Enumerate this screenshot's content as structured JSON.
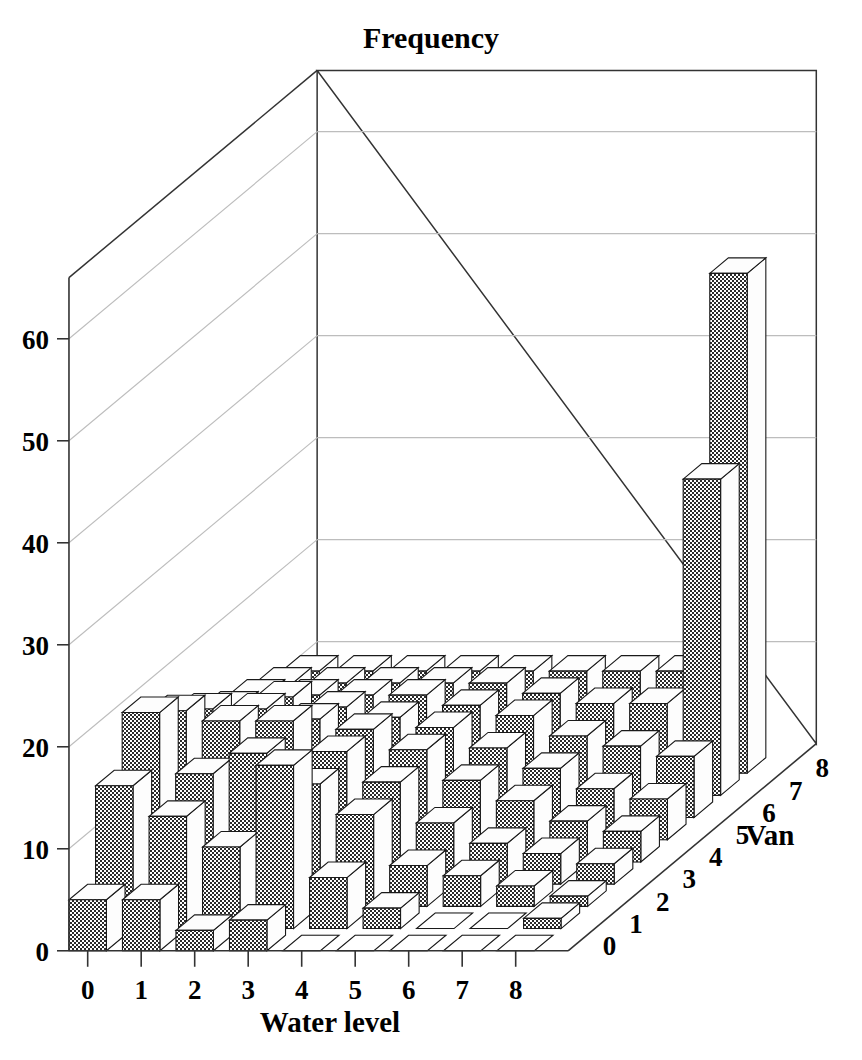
{
  "chart_data": {
    "type": "bar",
    "subtype": "3d-bar",
    "title": "Frequency",
    "xlabel": "Water level",
    "ylabel": "Frequency",
    "zlabel": "Van",
    "x_categories": [
      "0",
      "1",
      "2",
      "3",
      "4",
      "5",
      "6",
      "7",
      "8"
    ],
    "z_categories": [
      "0",
      "1",
      "2",
      "3",
      "4",
      "5",
      "6",
      "7",
      "8"
    ],
    "yticks": [
      "0",
      "10",
      "20",
      "30",
      "40",
      "50",
      "60"
    ],
    "ylim": [
      0,
      60
    ],
    "grid": true,
    "legend": "none",
    "values": [
      [
        5,
        5,
        2,
        3,
        0,
        0,
        0,
        0,
        0
      ],
      [
        14,
        11,
        8,
        16,
        5,
        2,
        0,
        0,
        1
      ],
      [
        19,
        13,
        15,
        12,
        9,
        4,
        3,
        2,
        1
      ],
      [
        17,
        16,
        16,
        13,
        10,
        6,
        4,
        3,
        2
      ],
      [
        15,
        15,
        14,
        13,
        11,
        8,
        6,
        4,
        3
      ],
      [
        13,
        14,
        13,
        12,
        11,
        9,
        7,
        5,
        4
      ],
      [
        12,
        12,
        12,
        12,
        11,
        10,
        8,
        7,
        6
      ],
      [
        11,
        11,
        11,
        11,
        11,
        10,
        9,
        9,
        31
      ],
      [
        10,
        10,
        10,
        10,
        10,
        10,
        10,
        10,
        49
      ]
    ],
    "max_value": 49,
    "colors": {
      "bar_front": "#595959",
      "bar_top": "#ffffff",
      "bar_side": "#ffffff",
      "outline": "#1a1a1a",
      "gridline": "#bdbdbd",
      "axis": "#333333",
      "background": "#ffffff"
    }
  }
}
